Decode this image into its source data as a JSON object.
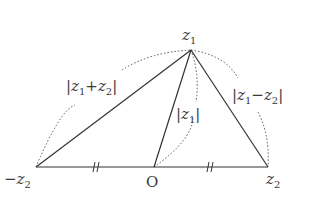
{
  "diagram": {
    "points": {
      "z1": {
        "label": "z",
        "sub": "1",
        "x": 191,
        "y": 50
      },
      "neg_z2": {
        "label": "−z",
        "sub": "2",
        "x": 36,
        "y": 167
      },
      "origin": {
        "label": "O",
        "x": 154,
        "y": 167
      },
      "z2": {
        "label": "z",
        "sub": "2",
        "x": 268,
        "y": 167
      }
    },
    "labels": {
      "sum": {
        "pre": "|z",
        "sub1": "1",
        "mid": "+z",
        "sub2": "2",
        "post": "|"
      },
      "diff": {
        "pre": "|z",
        "sub1": "1",
        "mid": "−z",
        "sub2": "2",
        "post": "|"
      },
      "mod": {
        "pre": "|z",
        "sub1": "1",
        "post": "|"
      }
    },
    "tick_marks": "equal-length marks on segments (−z2,O) and (O,z2)",
    "colors": {
      "line": "#333333",
      "dotted": "#555555",
      "text": "#3a3a3a"
    }
  }
}
